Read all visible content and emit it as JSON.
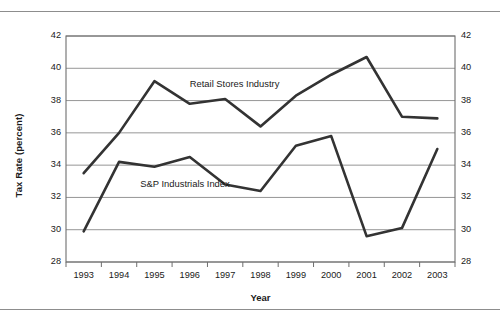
{
  "chart_data": {
    "type": "line",
    "title": "",
    "xlabel": "Year",
    "ylabel": "Tax Rate (percent)",
    "categories": [
      "1993",
      "1994",
      "1995",
      "1996",
      "1997",
      "1998",
      "1999",
      "2000",
      "2001",
      "2002",
      "2003"
    ],
    "ylim": [
      28,
      42
    ],
    "yticks": [
      28,
      30,
      32,
      34,
      36,
      38,
      40,
      42
    ],
    "grid": "horizontal",
    "legend_position": "inline-annotation",
    "dual_y_axis": true,
    "series": [
      {
        "name": "Retail Stores Industry",
        "color": "#333333",
        "values": [
          33.5,
          36.0,
          39.2,
          37.8,
          38.1,
          36.4,
          38.3,
          39.6,
          40.7,
          37.0,
          36.9
        ]
      },
      {
        "name": "S&P Industrials Index",
        "color": "#333333",
        "values": [
          29.9,
          34.2,
          33.9,
          34.5,
          32.8,
          32.4,
          35.2,
          35.8,
          29.6,
          30.1,
          35.0
        ]
      }
    ],
    "annotations": [
      {
        "text": "Retail Stores Industry",
        "x_value": 1996.0,
        "y_value": 38.95
      },
      {
        "text": "S&P Industrials Index",
        "x_value": 1994.6,
        "y_value": 32.75
      }
    ]
  },
  "axis": {
    "y_left_ticks": [
      "42",
      "40",
      "38",
      "36",
      "34",
      "32",
      "30",
      "28"
    ],
    "y_right_ticks": [
      "42",
      "40",
      "38",
      "36",
      "34",
      "32",
      "30",
      "28"
    ],
    "x_ticks": [
      "1993",
      "1994",
      "1995",
      "1996",
      "1997",
      "1998",
      "1999",
      "2000",
      "2001",
      "2002",
      "2003"
    ],
    "y_title": "Tax Rate (percent)",
    "x_title": "Year"
  },
  "footer": {
    "caption_fragment": ""
  },
  "colors": {
    "line": "#333333",
    "grid": "#8a8a8a",
    "frame": "#6e6e6e",
    "rule": "#8d8d8d",
    "text": "#1a1a1a"
  }
}
